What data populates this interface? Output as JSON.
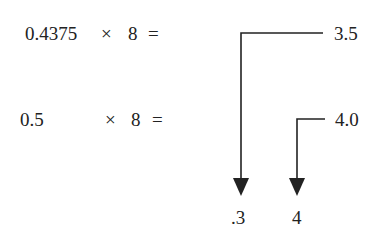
{
  "equations": [
    {
      "operand": "0.4375",
      "operator": "×",
      "multiplier": "8",
      "equals": "=",
      "result": "3.5"
    },
    {
      "operand": "0.5",
      "operator": "×",
      "multiplier": "8",
      "equals": "=",
      "result": "4.0"
    }
  ],
  "outputs": [
    ".3",
    "4"
  ],
  "colors": {
    "ink": "#222222",
    "background": "#ffffff"
  }
}
